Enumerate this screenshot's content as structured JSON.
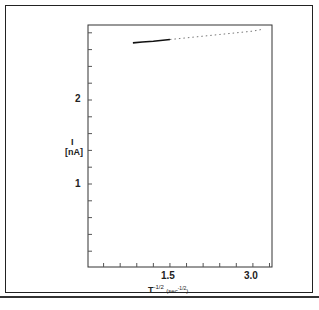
{
  "chart_data": {
    "type": "line",
    "title": "",
    "xlabel": "T^-1/2 (sec^-1/2)",
    "ylabel": "I (nA)",
    "x_ticks": [
      "1.5",
      "3.0"
    ],
    "y_ticks": [
      "1",
      "2"
    ],
    "xlim": [
      0,
      3.35
    ],
    "ylim": [
      0,
      2.9
    ],
    "grid": false,
    "series": [
      {
        "name": "current",
        "x": [
          0.83,
          1.0,
          1.2,
          1.5,
          1.8,
          2.1,
          2.4,
          2.7,
          3.0,
          3.16
        ],
        "y": [
          2.68,
          2.69,
          2.7,
          2.72,
          2.74,
          2.76,
          2.78,
          2.8,
          2.82,
          2.84
        ]
      }
    ]
  },
  "labels": {
    "y_title": "I",
    "y_unit": "[nA]",
    "x_title": "T",
    "x_exp": "-1/2",
    "x_unit": "(sec",
    "x_unit_exp": "-1/2",
    "x_unit_close": ")",
    "tick_y_2": "2",
    "tick_y_1": "1",
    "tick_x_15": "1.5",
    "tick_x_30": "3.0"
  }
}
